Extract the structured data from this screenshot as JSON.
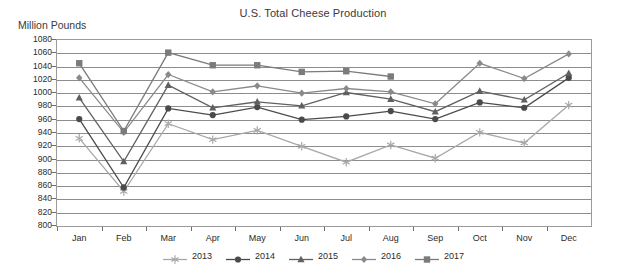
{
  "chart_data": {
    "type": "line",
    "title": "U.S. Total Cheese Production",
    "xlabel": "",
    "ylabel": "Million Pounds",
    "ylim": [
      800,
      1080
    ],
    "ytick_step": 20,
    "yticks": [
      800,
      820,
      840,
      860,
      880,
      900,
      920,
      940,
      960,
      980,
      1000,
      1020,
      1040,
      1060,
      1080
    ],
    "categories": [
      "Jan",
      "Feb",
      "Mar",
      "Apr",
      "May",
      "Jun",
      "Jul",
      "Aug",
      "Sep",
      "Oct",
      "Nov",
      "Dec"
    ],
    "grid": true,
    "legend_position": "bottom",
    "series": [
      {
        "name": "2013",
        "marker": "star",
        "color": "#a8a8a8",
        "values": [
          932,
          852,
          954,
          930,
          944,
          920,
          896,
          922,
          902,
          941,
          925,
          982
        ]
      },
      {
        "name": "2014",
        "marker": "circle",
        "color": "#4a4a4a",
        "values": [
          961,
          858,
          977,
          967,
          979,
          960,
          965,
          973,
          961,
          986,
          978,
          1023
        ]
      },
      {
        "name": "2015",
        "marker": "triangle",
        "color": "#606060",
        "values": [
          993,
          897,
          1012,
          978,
          987,
          981,
          1001,
          991,
          972,
          1003,
          990,
          1030
        ]
      },
      {
        "name": "2016",
        "marker": "diamond",
        "color": "#8a8a8a",
        "values": [
          1023,
          941,
          1028,
          1002,
          1011,
          1000,
          1007,
          1002,
          984,
          1045,
          1022,
          1059
        ]
      },
      {
        "name": "2017",
        "marker": "square",
        "color": "#7b7b7b",
        "values": [
          1045,
          943,
          1061,
          1042,
          1042,
          1032,
          1033,
          1025,
          null,
          null,
          null,
          null
        ]
      }
    ]
  }
}
